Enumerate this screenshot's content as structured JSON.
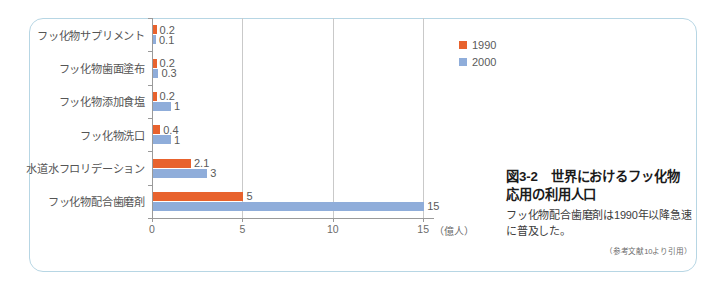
{
  "chart_data": {
    "type": "bar",
    "orientation": "horizontal",
    "title": "図3-2　世界におけるフッ化物応用の利用人口",
    "xlabel": "（億人）",
    "ylabel": "",
    "xlim": [
      0,
      15.6
    ],
    "xticks": [
      "0",
      "5",
      "10",
      "15"
    ],
    "xtick_values": [
      0,
      5,
      10,
      15
    ],
    "grid": true,
    "legend_position": "top-right",
    "categories": [
      "フッ化物サプリメント",
      "フッ化物歯面塗布",
      "フッ化物添加食塩",
      "フッ化物洗口",
      "水道水フロリデーション",
      "フッ化物配合歯磨剤"
    ],
    "series": [
      {
        "name": "1990",
        "color": "#e8622d",
        "values": [
          0.2,
          0.2,
          0.2,
          0.4,
          2.1,
          5
        ],
        "labels": [
          "0.2",
          "0.2",
          "0.2",
          "0.4",
          "2.1",
          "5"
        ]
      },
      {
        "name": "2000",
        "color": "#8fadda",
        "values": [
          0.1,
          0.3,
          1,
          1,
          3,
          15
        ],
        "labels": [
          "0.1",
          "0.3",
          "1",
          "1",
          "3",
          "15"
        ]
      }
    ]
  },
  "legend": {
    "items": [
      {
        "label": "1990",
        "color": "#e8622d"
      },
      {
        "label": "2000",
        "color": "#8fadda"
      }
    ]
  },
  "axis": {
    "unit": "（億人）",
    "ticks": [
      "0",
      "5",
      "10",
      "15"
    ]
  },
  "panel": {
    "title": "図3-2　世界におけるフッ化物応用の利用人口",
    "caption": "フッ化物配合歯磨剤は1990年以降急速に普及した。",
    "source": "（参考文献10より引用）"
  },
  "colors": {
    "frame_border": "#b7d6e4",
    "series_1990": "#e8622d",
    "series_2000": "#8fadda",
    "axis": "#9a9a9a",
    "gridline": "#c9c9c9"
  }
}
